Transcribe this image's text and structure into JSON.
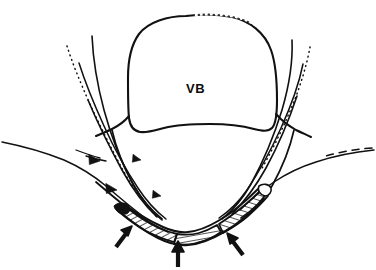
{
  "figure": {
    "type": "anatomical-line-drawing",
    "width": 376,
    "height": 270,
    "background_color": "#ffffff",
    "ink_color": "#111111"
  },
  "labels": [
    {
      "id": "vb",
      "text": "VB",
      "meaning": "vertebral body",
      "x": 196,
      "y": 88,
      "font_size": 13,
      "bold": true,
      "color": "#0d0d0d"
    }
  ],
  "arrowheads": [
    {
      "id": "arrowhead-left-upper",
      "x": 96,
      "y": 161,
      "size": 11,
      "angle": 200,
      "style": "solid-triangle"
    },
    {
      "id": "arrowhead-left-lower",
      "x": 112,
      "y": 190,
      "size": 11,
      "angle": 200,
      "style": "solid-triangle"
    },
    {
      "id": "arrowhead-mid-upper",
      "x": 137,
      "y": 161,
      "size": 8,
      "angle": 205,
      "style": "solid-triangle"
    },
    {
      "id": "arrowhead-mid-lower",
      "x": 157,
      "y": 196,
      "size": 8,
      "angle": 205,
      "style": "solid-triangle"
    }
  ],
  "arrows": [
    {
      "id": "arrow-left",
      "tail_x": 116,
      "tail_y": 247,
      "tip_x": 130,
      "tip_y": 228,
      "width": 4.2
    },
    {
      "id": "arrow-center",
      "tail_x": 178,
      "tail_y": 266,
      "tip_x": 178,
      "tip_y": 243,
      "width": 4.2
    },
    {
      "id": "arrow-right",
      "tail_x": 243,
      "tail_y": 255,
      "tip_x": 228,
      "tip_y": 234,
      "width": 4.2
    }
  ],
  "colors": {
    "ink": "#111111",
    "faint_ink": "#555555",
    "hatch": "#1a1a1a",
    "paper": "#ffffff"
  },
  "regions": [
    {
      "id": "vertebral-body",
      "name": "vertebral body outline"
    },
    {
      "id": "paraspinal-left",
      "name": "left paraspinal muscle planes"
    },
    {
      "id": "paraspinal-right",
      "name": "right paraspinal muscle planes"
    },
    {
      "id": "hatched-trough-left",
      "name": "left hatched ligament attachment"
    },
    {
      "id": "hatched-trough-center",
      "name": "central hatched ligament attachment"
    },
    {
      "id": "hatched-trough-right",
      "name": "right hatched ligament attachment"
    },
    {
      "id": "skin-contour-left",
      "name": "left skin surface contour"
    },
    {
      "id": "skin-contour-right",
      "name": "right skin surface contour"
    }
  ]
}
